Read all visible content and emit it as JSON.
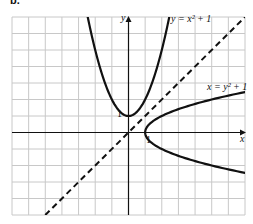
{
  "part_label": "b.",
  "chart_data": {
    "type": "line",
    "title": "",
    "xlabel": "x",
    "ylabel": "y",
    "grid": true,
    "xlim": [
      -7,
      7
    ],
    "ylim": [
      -5,
      7
    ],
    "tick_labels": {
      "x": [
        "1"
      ],
      "y": [
        "1"
      ]
    },
    "series": [
      {
        "name": "y = x^2 + 1",
        "style": "solid",
        "equation": "y = x^2 + 1",
        "vertex": [
          0,
          1
        ]
      },
      {
        "name": "x = y^2 + 1",
        "style": "solid",
        "equation": "x = y^2 + 1",
        "vertex": [
          1,
          0
        ]
      },
      {
        "name": "y = x",
        "style": "dashed",
        "equation": "y = x"
      }
    ],
    "annotations": [
      {
        "text": "y = x² + 1",
        "near": [
          2.2,
          6.6
        ]
      },
      {
        "text": "x = y² + 1",
        "near": [
          5.2,
          1.6
        ]
      }
    ]
  },
  "labels": {
    "x_axis": "x",
    "y_axis": "y",
    "tick_x": "1",
    "tick_y": "1",
    "curve1": "y = x² + 1",
    "curve2": "x = y² + 1"
  }
}
